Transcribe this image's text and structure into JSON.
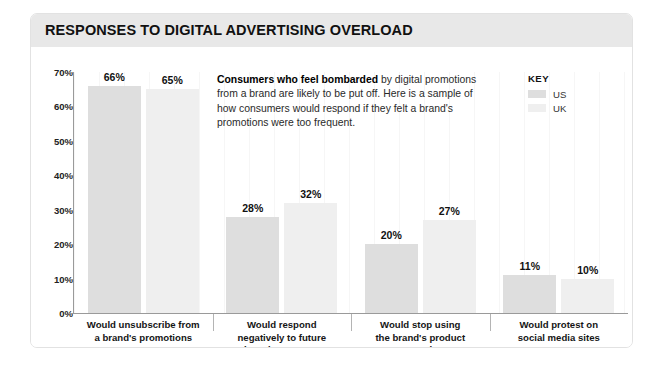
{
  "card": {
    "title": "RESPONSES TO DIGITAL ADVERTISING OVERLOAD"
  },
  "annotation": {
    "lead": "Consumers who feel bombarded",
    "body": " by digital promotions from a brand are likely to be put off. Here is a sample of how consumers would respond if they felt a brand's promotions were too frequent."
  },
  "key": {
    "title": "KEY",
    "items": [
      {
        "label": "US",
        "color": "#dedede"
      },
      {
        "label": "UK",
        "color": "#efefef"
      }
    ]
  },
  "chart_data": {
    "type": "bar",
    "title": "RESPONSES TO DIGITAL ADVERTISING OVERLOAD",
    "xlabel": "",
    "ylabel": "",
    "ylim": [
      0,
      70
    ],
    "ytick_labels": [
      "0%",
      "10%",
      "20%",
      "30%",
      "40%",
      "50%",
      "60%",
      "70%"
    ],
    "ytick_values": [
      0,
      10,
      20,
      30,
      40,
      50,
      60,
      70
    ],
    "grid": false,
    "legend_position": "top-right",
    "categories": [
      "Would unsubscribe from\na brand's promotions",
      "Would respond\nnegatively to future\nbrand messages",
      "Would stop using\nthe brand's product\nor service",
      "Would protest on\nsocial media sites"
    ],
    "category_lines": [
      [
        "Would unsubscribe from",
        "a brand's promotions"
      ],
      [
        "Would respond",
        "negatively to future",
        "brand messages"
      ],
      [
        "Would stop using",
        "the brand's product",
        "or service"
      ],
      [
        "Would protest on",
        "social media sites"
      ]
    ],
    "series": [
      {
        "name": "US",
        "color": "#dedede",
        "values": [
          66,
          28,
          20,
          11
        ],
        "value_labels": [
          "66%",
          "28%",
          "20%",
          "11%"
        ]
      },
      {
        "name": "UK",
        "color": "#efefef",
        "values": [
          65,
          32,
          27,
          10
        ],
        "value_labels": [
          "65%",
          "32%",
          "27%",
          "10%"
        ]
      }
    ]
  }
}
